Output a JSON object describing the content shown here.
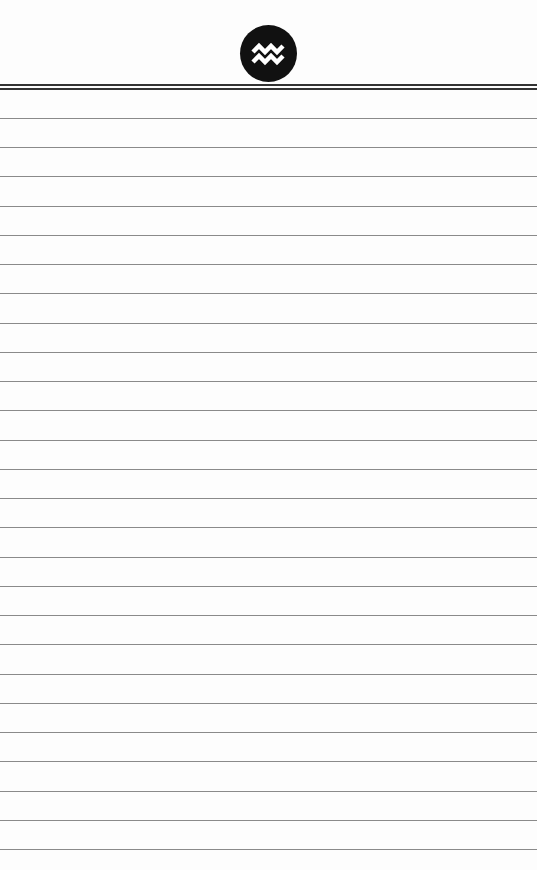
{
  "page": {
    "type": "lined-notepad",
    "emblem": {
      "icon": "aquarius-icon",
      "background": "#111111",
      "glyph_color": "#ffffff"
    },
    "header_rules": [
      84,
      88
    ],
    "lines": {
      "first_y": 118,
      "spacing": 29.24,
      "count": 26,
      "color": "#8a8a8a"
    }
  }
}
